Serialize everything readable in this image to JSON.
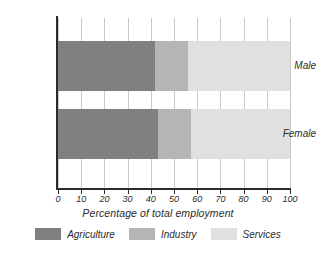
{
  "chart_data": {
    "type": "bar",
    "orientation": "horizontal",
    "stacked": true,
    "stacked_mode": "percent",
    "title": "",
    "xlabel": "Percentage of total employment",
    "ylabel": "",
    "xlim": [
      0,
      100
    ],
    "xticks": [
      0,
      10,
      20,
      30,
      40,
      50,
      60,
      70,
      80,
      90,
      100
    ],
    "xtick_labels": [
      "0",
      "10",
      "20",
      "30",
      "40",
      "50",
      "60",
      "70",
      "80",
      "90",
      "100"
    ],
    "grid": true,
    "grid_axis": "x",
    "legend_position": "bottom",
    "categories": [
      "Male",
      "Female"
    ],
    "series": [
      {
        "name": "Agriculture",
        "color": "#808080",
        "values": [
          42,
          43
        ]
      },
      {
        "name": "Industry",
        "color": "#b5b5b5",
        "values": [
          14,
          14.5
        ]
      },
      {
        "name": "Services",
        "color": "#e0e0e0",
        "values": [
          44,
          42.5
        ]
      }
    ],
    "cumulative_boundaries": {
      "Male": [
        42,
        56,
        100
      ],
      "Female": [
        43,
        57.5,
        100
      ]
    }
  },
  "axis": {
    "x_title": "Percentage of total employment",
    "tick_0": "0",
    "tick_10": "10",
    "tick_20": "20",
    "tick_30": "30",
    "tick_40": "40",
    "tick_50": "50",
    "tick_60": "60",
    "tick_70": "70",
    "tick_80": "80",
    "tick_90": "90",
    "tick_100": "100"
  },
  "categories": {
    "male": "Male",
    "female": "Female"
  },
  "legend": {
    "items": [
      {
        "label": "Agriculture",
        "color": "#808080"
      },
      {
        "label": "Industry",
        "color": "#b5b5b5"
      },
      {
        "label": "Services",
        "color": "#e0e0e0"
      }
    ]
  },
  "colors": {
    "agriculture": "#808080",
    "industry": "#b5b5b5",
    "services": "#e0e0e0",
    "axis": "#2b2b2b",
    "grid": "#c9c9c9",
    "background": "#ffffff"
  }
}
